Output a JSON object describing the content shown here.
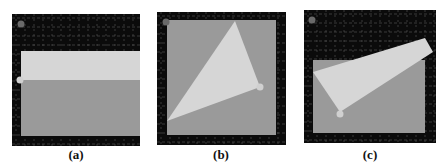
{
  "figure": {
    "panels": [
      {
        "id": "a",
        "label": "(a)",
        "x": 12,
        "y": 14,
        "w": 128,
        "h": 132,
        "inner": {
          "x": 9,
          "y": 37,
          "w": 119,
          "h": 85
        },
        "light_poly": "9,37 128,37 128,66 9,66",
        "dot": {
          "cx": 8,
          "cy": 66
        },
        "corner_dot": {
          "cx": 9,
          "cy": 10
        }
      },
      {
        "id": "b",
        "label": "(b)",
        "x": 157,
        "y": 12,
        "w": 129,
        "h": 133,
        "inner": {
          "x": 10,
          "y": 8,
          "w": 109,
          "h": 115
        },
        "light_poly": "78,9 103,75 10,109",
        "dot": {
          "cx": 103,
          "cy": 75
        },
        "corner_dot": {
          "cx": 9,
          "cy": 10
        }
      },
      {
        "id": "c",
        "label": "(c)",
        "x": 304,
        "y": 10,
        "w": 132,
        "h": 133,
        "inner": {
          "x": 9,
          "y": 50,
          "w": 112,
          "h": 73
        },
        "light_poly": "9,62 121,28 129,42 36,102",
        "dot": {
          "cx": 36,
          "cy": 104
        },
        "corner_dot": {
          "cx": 8,
          "cy": 10
        }
      }
    ],
    "colors": {
      "background": "#0b0b0b",
      "grid": "#5a5a5a",
      "gray": "#9a9a9a",
      "light": "#d6d6d6",
      "dot": "#d0d0d0",
      "corner_dot": "#6a6a6a"
    }
  },
  "labels": {
    "a": "(a)",
    "b": "(b)",
    "c": "(c)"
  }
}
